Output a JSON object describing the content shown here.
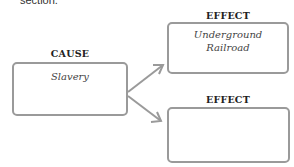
{
  "header": {
    "cut_text": "section."
  },
  "cause": {
    "label": "CAUSE",
    "text": "Slavery"
  },
  "effects": [
    {
      "label": "EFFECT",
      "text_line1": "Underground",
      "text_line2": "Railroad"
    },
    {
      "label": "EFFECT",
      "text_line1": "",
      "text_line2": ""
    }
  ],
  "colors": {
    "box_border": "#9a9a9a",
    "arrow": "#9a9a9a",
    "label_text": "#222222"
  }
}
